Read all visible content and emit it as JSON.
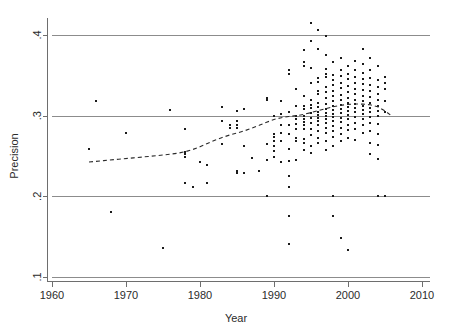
{
  "chart_data": {
    "type": "scatter",
    "title": "",
    "xlabel": "Year",
    "ylabel": "Precision",
    "xlim": [
      1960,
      2010
    ],
    "ylim": [
      0.1,
      0.42
    ],
    "grid": true,
    "grid_axis": "y",
    "legend": "none",
    "xticks": [
      1960,
      1970,
      1980,
      1990,
      2000,
      2010
    ],
    "xtick_labels": [
      "1960",
      "1970",
      "1980",
      "1990",
      "2000",
      "2010"
    ],
    "yticks": [
      0.1,
      0.2,
      0.3,
      0.4
    ],
    "ytick_labels": [
      ".1",
      ".2",
      ".3",
      ".4"
    ],
    "marker": "square",
    "marker_color": "#1a1a1a",
    "marker_size_px": 2,
    "series": [
      {
        "name": "observations",
        "points": [
          [
            1965,
            0.259
          ],
          [
            1966,
            0.318
          ],
          [
            1968,
            0.181
          ],
          [
            1970,
            0.279
          ],
          [
            1975,
            0.136
          ],
          [
            1976,
            0.307
          ],
          [
            1978,
            0.217
          ],
          [
            1978,
            0.252
          ],
          [
            1978,
            0.255
          ],
          [
            1978,
            0.249
          ],
          [
            1978,
            0.283
          ],
          [
            1979,
            0.211
          ],
          [
            1980,
            0.243
          ],
          [
            1981,
            0.239
          ],
          [
            1981,
            0.217
          ],
          [
            1983,
            0.311
          ],
          [
            1983,
            0.293
          ],
          [
            1983,
            0.265
          ],
          [
            1984,
            0.285
          ],
          [
            1984,
            0.289
          ],
          [
            1985,
            0.306
          ],
          [
            1985,
            0.293
          ],
          [
            1985,
            0.289
          ],
          [
            1985,
            0.285
          ],
          [
            1985,
            0.232
          ],
          [
            1985,
            0.229
          ],
          [
            1986,
            0.308
          ],
          [
            1986,
            0.262
          ],
          [
            1986,
            0.229
          ],
          [
            1987,
            0.247
          ],
          [
            1988,
            0.231
          ],
          [
            1989,
            0.2
          ],
          [
            1989,
            0.245
          ],
          [
            1989,
            0.322
          ],
          [
            1989,
            0.319
          ],
          [
            1989,
            0.265
          ],
          [
            1990,
            0.299
          ],
          [
            1990,
            0.277
          ],
          [
            1990,
            0.273
          ],
          [
            1990,
            0.268
          ],
          [
            1990,
            0.262
          ],
          [
            1990,
            0.256
          ],
          [
            1990,
            0.249
          ],
          [
            1991,
            0.318
          ],
          [
            1991,
            0.302
          ],
          [
            1991,
            0.289
          ],
          [
            1991,
            0.278
          ],
          [
            1991,
            0.269
          ],
          [
            1991,
            0.243
          ],
          [
            1992,
            0.356
          ],
          [
            1992,
            0.352
          ],
          [
            1992,
            0.305
          ],
          [
            1992,
            0.288
          ],
          [
            1992,
            0.277
          ],
          [
            1992,
            0.259
          ],
          [
            1992,
            0.244
          ],
          [
            1992,
            0.225
          ],
          [
            1992,
            0.211
          ],
          [
            1992,
            0.176
          ],
          [
            1992,
            0.141
          ],
          [
            1993,
            0.333
          ],
          [
            1993,
            0.312
          ],
          [
            1993,
            0.3
          ],
          [
            1993,
            0.299
          ],
          [
            1993,
            0.296
          ],
          [
            1993,
            0.29
          ],
          [
            1993,
            0.283
          ],
          [
            1993,
            0.272
          ],
          [
            1993,
            0.268
          ],
          [
            1993,
            0.245
          ],
          [
            1994,
            0.381
          ],
          [
            1994,
            0.366
          ],
          [
            1994,
            0.361
          ],
          [
            1994,
            0.325
          ],
          [
            1994,
            0.312
          ],
          [
            1994,
            0.308
          ],
          [
            1994,
            0.299
          ],
          [
            1994,
            0.296
          ],
          [
            1994,
            0.292
          ],
          [
            1994,
            0.288
          ],
          [
            1994,
            0.283
          ],
          [
            1994,
            0.271
          ],
          [
            1994,
            0.266
          ],
          [
            1994,
            0.258
          ],
          [
            1995,
            0.415
          ],
          [
            1995,
            0.392
          ],
          [
            1995,
            0.359
          ],
          [
            1995,
            0.341
          ],
          [
            1995,
            0.32
          ],
          [
            1995,
            0.313
          ],
          [
            1995,
            0.309
          ],
          [
            1995,
            0.303
          ],
          [
            1995,
            0.297
          ],
          [
            1995,
            0.291
          ],
          [
            1995,
            0.284
          ],
          [
            1995,
            0.276
          ],
          [
            1995,
            0.262
          ],
          [
            1995,
            0.254
          ],
          [
            1996,
            0.406
          ],
          [
            1996,
            0.383
          ],
          [
            1996,
            0.347
          ],
          [
            1996,
            0.342
          ],
          [
            1996,
            0.331
          ],
          [
            1996,
            0.327
          ],
          [
            1996,
            0.316
          ],
          [
            1996,
            0.311
          ],
          [
            1996,
            0.305
          ],
          [
            1996,
            0.301
          ],
          [
            1996,
            0.297
          ],
          [
            1996,
            0.293
          ],
          [
            1996,
            0.288
          ],
          [
            1996,
            0.281
          ],
          [
            1996,
            0.272
          ],
          [
            1996,
            0.266
          ],
          [
            1997,
            0.399
          ],
          [
            1997,
            0.375
          ],
          [
            1997,
            0.358
          ],
          [
            1997,
            0.352
          ],
          [
            1997,
            0.348
          ],
          [
            1997,
            0.336
          ],
          [
            1997,
            0.329
          ],
          [
            1997,
            0.322
          ],
          [
            1997,
            0.314
          ],
          [
            1997,
            0.308
          ],
          [
            1997,
            0.303
          ],
          [
            1997,
            0.299
          ],
          [
            1997,
            0.296
          ],
          [
            1997,
            0.291
          ],
          [
            1997,
            0.285
          ],
          [
            1997,
            0.278
          ],
          [
            1997,
            0.269
          ],
          [
            1997,
            0.258
          ],
          [
            1998,
            0.366
          ],
          [
            1998,
            0.351
          ],
          [
            1998,
            0.344
          ],
          [
            1998,
            0.338
          ],
          [
            1998,
            0.331
          ],
          [
            1998,
            0.325
          ],
          [
            1998,
            0.318
          ],
          [
            1998,
            0.312
          ],
          [
            1998,
            0.307
          ],
          [
            1998,
            0.302
          ],
          [
            1998,
            0.298
          ],
          [
            1998,
            0.293
          ],
          [
            1998,
            0.287
          ],
          [
            1998,
            0.281
          ],
          [
            1998,
            0.274
          ],
          [
            1998,
            0.262
          ],
          [
            1998,
            0.2
          ],
          [
            1998,
            0.176
          ],
          [
            1999,
            0.371
          ],
          [
            1999,
            0.356
          ],
          [
            1999,
            0.349
          ],
          [
            1999,
            0.341
          ],
          [
            1999,
            0.334
          ],
          [
            1999,
            0.326
          ],
          [
            1999,
            0.319
          ],
          [
            1999,
            0.313
          ],
          [
            1999,
            0.308
          ],
          [
            1999,
            0.303
          ],
          [
            1999,
            0.297
          ],
          [
            1999,
            0.292
          ],
          [
            1999,
            0.285
          ],
          [
            1999,
            0.277
          ],
          [
            1999,
            0.268
          ],
          [
            1999,
            0.148
          ],
          [
            2000,
            0.362
          ],
          [
            2000,
            0.352
          ],
          [
            2000,
            0.345
          ],
          [
            2000,
            0.337
          ],
          [
            2000,
            0.329
          ],
          [
            2000,
            0.322
          ],
          [
            2000,
            0.316
          ],
          [
            2000,
            0.311
          ],
          [
            2000,
            0.306
          ],
          [
            2000,
            0.301
          ],
          [
            2000,
            0.296
          ],
          [
            2000,
            0.289
          ],
          [
            2000,
            0.282
          ],
          [
            2000,
            0.272
          ],
          [
            2000,
            0.133
          ],
          [
            2001,
            0.368
          ],
          [
            2001,
            0.357
          ],
          [
            2001,
            0.348
          ],
          [
            2001,
            0.341
          ],
          [
            2001,
            0.333
          ],
          [
            2001,
            0.327
          ],
          [
            2001,
            0.32
          ],
          [
            2001,
            0.314
          ],
          [
            2001,
            0.309
          ],
          [
            2001,
            0.304
          ],
          [
            2001,
            0.298
          ],
          [
            2001,
            0.291
          ],
          [
            2001,
            0.283
          ],
          [
            2001,
            0.27
          ],
          [
            2002,
            0.383
          ],
          [
            2002,
            0.364
          ],
          [
            2002,
            0.353
          ],
          [
            2002,
            0.346
          ],
          [
            2002,
            0.339
          ],
          [
            2002,
            0.332
          ],
          [
            2002,
            0.325
          ],
          [
            2002,
            0.318
          ],
          [
            2002,
            0.312
          ],
          [
            2002,
            0.307
          ],
          [
            2002,
            0.302
          ],
          [
            2002,
            0.296
          ],
          [
            2002,
            0.288
          ],
          [
            2002,
            0.279
          ],
          [
            2003,
            0.371
          ],
          [
            2003,
            0.356
          ],
          [
            2003,
            0.347
          ],
          [
            2003,
            0.338
          ],
          [
            2003,
            0.33
          ],
          [
            2003,
            0.323
          ],
          [
            2003,
            0.316
          ],
          [
            2003,
            0.31
          ],
          [
            2003,
            0.304
          ],
          [
            2003,
            0.298
          ],
          [
            2003,
            0.291
          ],
          [
            2003,
            0.281
          ],
          [
            2003,
            0.266
          ],
          [
            2003,
            0.253
          ],
          [
            2004,
            0.361
          ],
          [
            2004,
            0.344
          ],
          [
            2004,
            0.336
          ],
          [
            2004,
            0.327
          ],
          [
            2004,
            0.319
          ],
          [
            2004,
            0.312
          ],
          [
            2004,
            0.306
          ],
          [
            2004,
            0.299
          ],
          [
            2004,
            0.29
          ],
          [
            2004,
            0.277
          ],
          [
            2004,
            0.264
          ],
          [
            2004,
            0.246
          ],
          [
            2004,
            0.2
          ],
          [
            2005,
            0.348
          ],
          [
            2005,
            0.34
          ],
          [
            2005,
            0.333
          ],
          [
            2005,
            0.318
          ],
          [
            2005,
            0.305
          ],
          [
            2005,
            0.2
          ]
        ]
      }
    ],
    "trend": {
      "name": "lowess-fit",
      "style": "dashed",
      "color": "#2b2b2b",
      "points": [
        [
          1965.0,
          0.2425
        ],
        [
          1967.0,
          0.2443
        ],
        [
          1969.0,
          0.246
        ],
        [
          1971.0,
          0.2477
        ],
        [
          1973.0,
          0.2494
        ],
        [
          1975.0,
          0.2512
        ],
        [
          1977.0,
          0.2535
        ],
        [
          1978.0,
          0.2553
        ],
        [
          1979.0,
          0.258
        ],
        [
          1980.0,
          0.2615
        ],
        [
          1981.0,
          0.2655
        ],
        [
          1982.0,
          0.2695
        ],
        [
          1983.0,
          0.273
        ],
        [
          1984.0,
          0.276
        ],
        [
          1985.0,
          0.2785
        ],
        [
          1986.0,
          0.2812
        ],
        [
          1987.0,
          0.2845
        ],
        [
          1988.0,
          0.288
        ],
        [
          1989.0,
          0.2918
        ],
        [
          1990.0,
          0.2953
        ],
        [
          1991.0,
          0.2975
        ],
        [
          1992.0,
          0.299
        ],
        [
          1993.0,
          0.3
        ],
        [
          1994.0,
          0.3015
        ],
        [
          1995.0,
          0.3038
        ],
        [
          1996.0,
          0.3063
        ],
        [
          1997.0,
          0.3088
        ],
        [
          1998.0,
          0.311
        ],
        [
          1999.0,
          0.3128
        ],
        [
          2000.0,
          0.314
        ],
        [
          2001.0,
          0.3145
        ],
        [
          2002.0,
          0.3143
        ],
        [
          2003.0,
          0.3135
        ],
        [
          2004.0,
          0.311
        ],
        [
          2005.0,
          0.306
        ],
        [
          2006.0,
          0.299
        ]
      ]
    }
  },
  "axes": {
    "y_title": "Precision",
    "x_title": "Year"
  }
}
